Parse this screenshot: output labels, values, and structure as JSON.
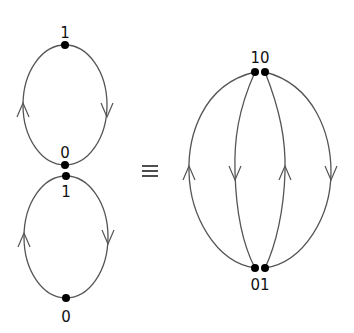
{
  "diagram": {
    "left": {
      "upper_loop": {
        "top_label": "1",
        "bottom_label": "0",
        "left_arrow": "up",
        "right_arrow": "down"
      },
      "lower_loop": {
        "top_label": "1",
        "bottom_label": "0",
        "left_arrow": "up",
        "right_arrow": "down"
      }
    },
    "relation_symbol": "≡",
    "right": {
      "top_label": "10",
      "bottom_label": "01",
      "edges": [
        {
          "name": "outer-left",
          "arrow": "up"
        },
        {
          "name": "inner-left",
          "arrow": "down"
        },
        {
          "name": "inner-right",
          "arrow": "up"
        },
        {
          "name": "outer-right",
          "arrow": "down"
        }
      ]
    },
    "colors": {
      "edge": "#555555",
      "node": "#000000",
      "text": "#111111"
    }
  }
}
